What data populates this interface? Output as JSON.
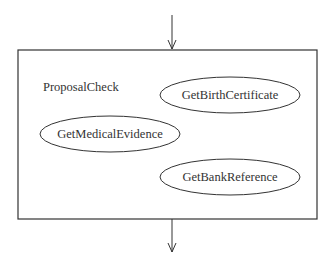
{
  "diagram": {
    "container": {
      "label": "ProposalCheck",
      "x": 18,
      "y": 50,
      "width": 299,
      "height": 169
    },
    "incoming_arrow": {
      "x": 172,
      "y1": 15,
      "y2": 50
    },
    "outgoing_arrow": {
      "x": 172,
      "y1": 219,
      "y2": 252
    },
    "activities": [
      {
        "label": "GetBirthCertificate",
        "cx": 230,
        "cy": 95,
        "rx": 70,
        "ry": 18
      },
      {
        "label": "GetMedicalEvidence",
        "cx": 110,
        "cy": 134,
        "rx": 70,
        "ry": 18
      },
      {
        "label": "GetBankReference",
        "cx": 230,
        "cy": 177,
        "rx": 70,
        "ry": 18
      }
    ],
    "colors": {
      "stroke": "#333333",
      "background": "#ffffff"
    }
  }
}
